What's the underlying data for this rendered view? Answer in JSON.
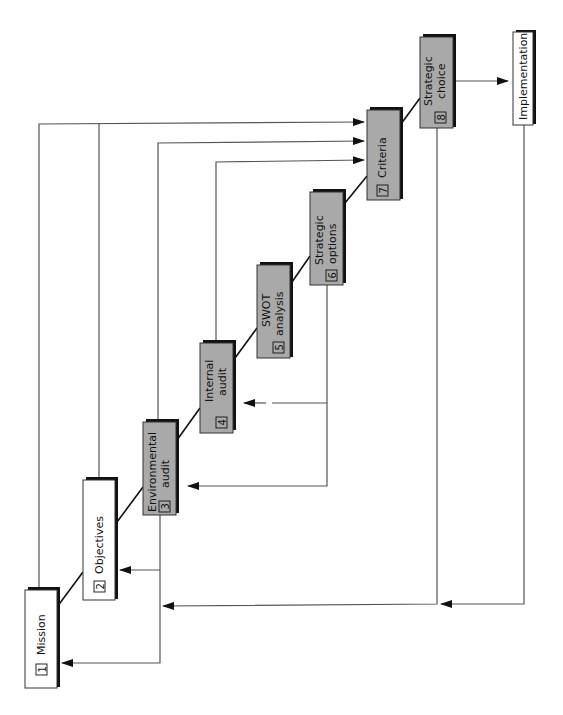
{
  "diagram": {
    "title": "",
    "orientation": "rotated-90-ccw",
    "steps": [
      {
        "id": 1,
        "number": "1",
        "line1": "Mission",
        "line2": "",
        "style": "white"
      },
      {
        "id": 2,
        "number": "2",
        "line1": "Objectives",
        "line2": "",
        "style": "white"
      },
      {
        "id": 3,
        "number": "3",
        "line1": "Environmental",
        "line2": "audit",
        "style": "gray"
      },
      {
        "id": 4,
        "number": "4",
        "line1": "Internal",
        "line2": "audit",
        "style": "gray"
      },
      {
        "id": 5,
        "number": "5",
        "line1": "SWOT",
        "line2": "analysis",
        "style": "gray"
      },
      {
        "id": 6,
        "number": "6",
        "line1": "Strategic",
        "line2": "options",
        "style": "gray"
      },
      {
        "id": 7,
        "number": "7",
        "line1": "Criteria",
        "line2": "",
        "style": "gray"
      },
      {
        "id": 8,
        "number": "8",
        "line1": "Strategic",
        "line2": "choice",
        "style": "gray"
      }
    ],
    "terminal": {
      "label": "Implementation",
      "style": "white"
    },
    "connections": [
      {
        "from": "1",
        "to": "2",
        "type": "sequence"
      },
      {
        "from": "2",
        "to": "3",
        "type": "sequence"
      },
      {
        "from": "3",
        "to": "4",
        "type": "sequence"
      },
      {
        "from": "4",
        "to": "5",
        "type": "sequence"
      },
      {
        "from": "5",
        "to": "6",
        "type": "sequence"
      },
      {
        "from": "6",
        "to": "7",
        "type": "sequence"
      },
      {
        "from": "7",
        "to": "8",
        "type": "sequence"
      },
      {
        "from": "8",
        "to": "Implementation",
        "type": "arrow"
      },
      {
        "from": "1",
        "to": "7",
        "type": "input"
      },
      {
        "from": "2",
        "to": "7",
        "type": "input"
      },
      {
        "from": "3",
        "to": "7",
        "type": "input"
      },
      {
        "from": "4",
        "to": "7",
        "type": "input"
      },
      {
        "from": "3",
        "to": "1",
        "type": "feedback"
      },
      {
        "from": "3",
        "to": "2",
        "type": "feedback"
      },
      {
        "from": "6",
        "to": "3",
        "type": "feedback"
      },
      {
        "from": "6",
        "to": "4",
        "type": "feedback-dashed"
      },
      {
        "from": "8",
        "to": "1",
        "type": "feedback"
      },
      {
        "from": "Implementation",
        "to": "1",
        "type": "feedback"
      }
    ],
    "colors": {
      "gray_fill": "#a9a9a9",
      "white_fill": "#ffffff",
      "line": "#555555",
      "shadow": "#111111"
    }
  }
}
